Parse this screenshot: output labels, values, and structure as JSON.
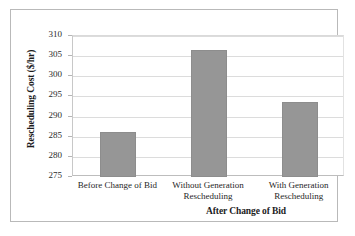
{
  "chart_data": {
    "type": "bar",
    "title": "",
    "subtitle": "",
    "categories": [
      "Before Change of Bid",
      "Without Generation Rescheduling",
      "With Generation Rescheduling"
    ],
    "values": [
      286.1,
      306.5,
      293.6
    ],
    "series": [
      {
        "name": "Rescheduling Cost",
        "values": [
          286.1,
          306.5,
          293.6
        ]
      }
    ],
    "xlabel": "After Change of Bid",
    "ylabel": "Rescheduling Cost ($/hr)",
    "ylim": [
      275,
      310
    ],
    "ytick_step": 5,
    "yticks": [
      275,
      280,
      285,
      290,
      295,
      300,
      305,
      310
    ],
    "ytick_labels": [
      "275",
      "280",
      "285",
      "290",
      "295",
      "300",
      "305",
      "310"
    ],
    "grid": "horizontal",
    "legend": "none",
    "bar_color": "#969696",
    "gridline_color": "#dcdcdc",
    "axis_color": "#bdbdbd",
    "frame_color": "#b9b9b9",
    "text_color": "#1c1c1c"
  }
}
